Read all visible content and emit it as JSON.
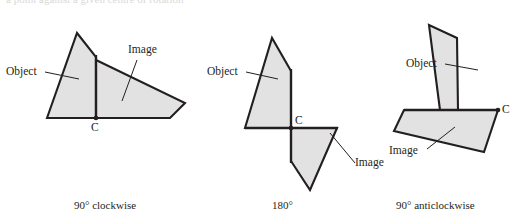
{
  "figures": [
    {
      "id": "fig-90-clockwise",
      "caption": "90° clockwise",
      "center_label": "C",
      "object_label": "Object",
      "image_label": "Image"
    },
    {
      "id": "fig-180",
      "caption": "180°",
      "center_label": "C",
      "object_label": "Object",
      "image_label": "Image"
    },
    {
      "id": "fig-90-anticlockwise",
      "caption": "90° anticlockwise",
      "center_label": "C",
      "object_label": "Object",
      "image_label": "Image"
    }
  ],
  "style": {
    "shape_fill": "#e2e2e2",
    "shape_stroke": "#231f20",
    "background": "#ffffff"
  },
  "geometry": {
    "fig1": {
      "object_points": "47,118 77,33 96,57 96,118",
      "image_points": "96,60 185,103 171,118 96,118",
      "axis": "96,55 96,119",
      "center": "96,118"
    },
    "fig2": {
      "object_points": "245,128 272,38 291,71 291,128",
      "image_points": "291,128 336,128 337,103 290,104",
      "image_points_real": "291,128 337,103 309,190 291,175",
      "axis_h": "245,128 337,128",
      "axis_v": "291,70 291,176",
      "center": "291,128"
    },
    "fig3": {
      "object_points": "404,110 421,25 442,36 442,110",
      "image_points": "404,110 442,110 442,146 366,128",
      "image_points_real": "404,110 442,110 442,147 366,128 380,112",
      "axis_h": "404,110 498,110",
      "center": "498,110"
    }
  },
  "top_partial_line": "a point against a given centre of rotation"
}
